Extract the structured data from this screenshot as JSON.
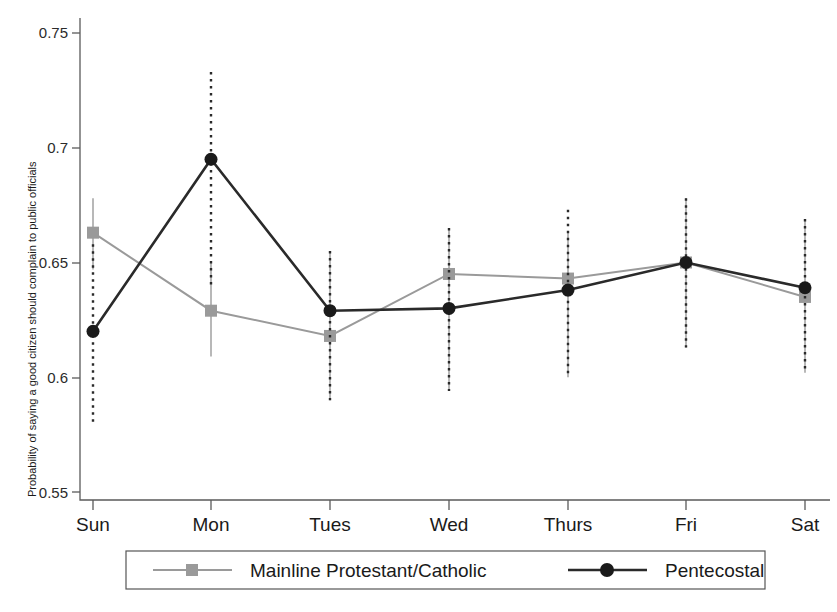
{
  "chart_data": {
    "type": "line",
    "title": "",
    "subtitle": "",
    "xlabel": "",
    "ylabel": "Probability of saying a good citizen should complain to public officials",
    "categories": [
      "Sun",
      "Mon",
      "Tues",
      "Wed",
      "Thurs",
      "Fri",
      "Sat"
    ],
    "ylim": [
      0.55,
      0.75
    ],
    "yticks": [
      0.55,
      0.6,
      0.65,
      0.7,
      0.75
    ],
    "ytick_labels": [
      "0.55",
      "0.6",
      "0.65",
      "0.7",
      "0.75"
    ],
    "grid": false,
    "legend_position": "bottom",
    "series": [
      {
        "name": "Mainline Protestant/Catholic",
        "color": "#9a9a9a",
        "marker": "square",
        "values": [
          0.663,
          0.629,
          0.618,
          0.645,
          0.643,
          0.65,
          0.635
        ],
        "ci_low": [
          0.647,
          0.609,
          0.59,
          0.594,
          0.6,
          0.613,
          0.602
        ],
        "ci_high": [
          0.678,
          0.65,
          0.655,
          0.665,
          0.663,
          0.678,
          0.669
        ]
      },
      {
        "name": "Pentecostal",
        "color": "#2a2a2a",
        "marker": "circle",
        "values": [
          0.62,
          0.695,
          0.629,
          0.63,
          0.638,
          0.65,
          0.639
        ],
        "ci_low": [
          0.58,
          0.64,
          0.59,
          0.594,
          0.6,
          0.613,
          0.602
        ],
        "ci_high": [
          0.658,
          0.733,
          0.655,
          0.665,
          0.673,
          0.678,
          0.669
        ]
      }
    ]
  },
  "legend": {
    "entries": [
      {
        "label": "Mainline Protestant/Catholic",
        "marker": "square-marker",
        "color": "#9a9a9a"
      },
      {
        "label": "Pentecostal",
        "marker": "circle-marker",
        "color": "#2a2a2a"
      }
    ]
  }
}
